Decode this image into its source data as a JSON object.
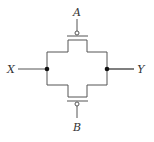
{
  "diagram": {
    "type": "transmission-gate-circuit",
    "labels": {
      "input": "X",
      "output": "Y",
      "gate_top": "A",
      "gate_bottom": "B"
    },
    "components": [
      {
        "name": "top-pmos-transistor",
        "gate": "A",
        "bubble": true
      },
      {
        "name": "bottom-pmos-transistor",
        "gate": "B",
        "bubble": true
      }
    ],
    "nodes": [
      "X",
      "Y"
    ],
    "colors": {
      "stroke": "#555555",
      "node": "#111111",
      "text": "#333333"
    }
  }
}
